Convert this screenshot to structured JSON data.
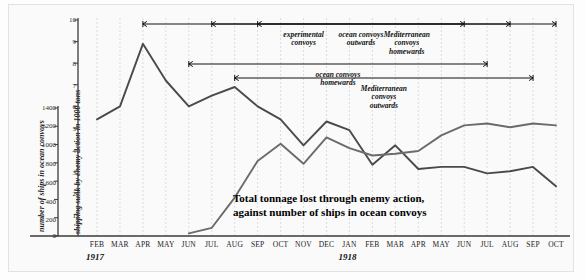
{
  "chart_data": {
    "type": "line",
    "title": "Total tonnage lost through enemy action, against number of ships in ocean convoys",
    "caption_line1": "Total tonnage lost through enemy action,",
    "caption_line2": "against number of ships in ocean convoys",
    "xlabel": "",
    "ylabel_left": "number of ships in ocean convoys",
    "ylabel_right": "shipping sunk by enemy action in 1000 tons",
    "grid": true,
    "legend_position": "none",
    "x": [
      "FEB",
      "MAR",
      "APR",
      "MAY",
      "JUN",
      "JUL",
      "AUG",
      "SEP",
      "OCT",
      "NOV",
      "DEC",
      "JAN",
      "FEB",
      "MAR",
      "APR",
      "MAY",
      "JUN",
      "JUL",
      "AUG",
      "SEP",
      "OCT"
    ],
    "year_labels": [
      {
        "text": "1917",
        "at_month": "FEB"
      },
      {
        "text": "1918",
        "at_month": "JAN"
      }
    ],
    "left_axis": {
      "label": "number of ships in ocean convoys",
      "ticks": [
        0,
        200,
        400,
        600,
        800,
        1000,
        1200,
        1400
      ],
      "ylim": [
        0,
        1500
      ]
    },
    "right_axis": {
      "label": "shipping sunk by enemy action in 1000 tons",
      "ticks": [
        1,
        2,
        3,
        4,
        5,
        6,
        7,
        8,
        9,
        10
      ],
      "ylim": [
        0,
        10
      ]
    },
    "series": [
      {
        "name": "shipping sunk by enemy action in 1000 tons",
        "axis": "right",
        "color": "#4a4a4a",
        "units": "1000 tons",
        "values": [
          5.4,
          6.0,
          8.9,
          7.2,
          6.0,
          6.5,
          6.9,
          6.0,
          5.4,
          4.2,
          5.3,
          4.9,
          3.3,
          4.2,
          3.1,
          3.2,
          3.2,
          2.9,
          3.0,
          3.2,
          2.3
        ]
      },
      {
        "name": "number of ships in ocean convoys",
        "axis": "left",
        "color": "#6b6b6b",
        "units": "ships",
        "values": [
          0,
          0,
          0,
          0,
          30,
          90,
          420,
          820,
          1010,
          790,
          1080,
          960,
          880,
          900,
          930,
          1100,
          1210,
          1230,
          1190,
          1230,
          1210
        ]
      }
    ],
    "annotations": [
      {
        "id": "experimental-convoys",
        "lines": [
          "experimental",
          "convoys"
        ],
        "span_start": "APR",
        "span_end": "JUN"
      },
      {
        "id": "ocean-convoys-outwards",
        "lines": [
          "ocean convoys",
          "outwards"
        ],
        "span_start": "JUL",
        "span_end": "AUG"
      },
      {
        "id": "mediterranean-convoys-homewards",
        "lines": [
          "Mediterranean",
          "convoys",
          "homewards"
        ],
        "span_start": "SEP",
        "span_end": "OCT"
      },
      {
        "id": "ocean-convoys-homewards",
        "lines": [
          "ocean convoys",
          "homewards"
        ],
        "span_start": "JUN",
        "span_end": "JUL"
      },
      {
        "id": "mediterranean-convoys-outwards",
        "lines": [
          "Mediterranean",
          "convoys",
          "outwards"
        ],
        "span_start": "AUG",
        "span_end": "SEP"
      }
    ]
  },
  "colors": {
    "background": "#fafafa",
    "panel_border": "#e2e2e2",
    "axis": "#3a3a3a",
    "gridline": "#cfcfcf",
    "tonnage_line": "#4a4a4a",
    "ships_line": "#6b6b6b",
    "text": "#111111"
  }
}
